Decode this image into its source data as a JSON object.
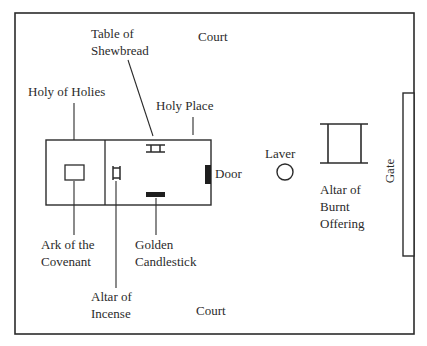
{
  "diagram": {
    "colors": {
      "line": "#2b2b2b",
      "fill": "#ffffff",
      "solid": "#1e1e1e"
    },
    "labels": {
      "court_top": "Court",
      "court_bottom": "Court",
      "table_of_shewbread": [
        "Table of",
        "Shewbread"
      ],
      "holy_of_holies": "Holy of Holies",
      "holy_place": "Holy Place",
      "door": "Door",
      "laver": "Laver",
      "altar_of_burnt_offering": [
        "Altar of",
        "Burnt",
        "Offering"
      ],
      "gate": "Gate",
      "ark_of_the_covenant": [
        "Ark of the",
        "Covenant"
      ],
      "golden_candlestick": [
        "Golden",
        "Candlestick"
      ],
      "altar_of_incense": [
        "Altar of",
        "Incense"
      ]
    }
  }
}
